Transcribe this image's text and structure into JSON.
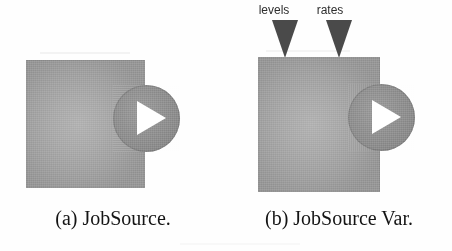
{
  "figure": {
    "background_color": "#fefefe",
    "box_fill_color": "#a8a8a8",
    "circle_fill_color": "#8f8f8f",
    "play_glyph_color": "#ffffff",
    "marker_color": "#4a4a4a",
    "text_color": "#141414"
  },
  "panels": [
    {
      "id": "a",
      "caption": "(a) JobSource.",
      "component_name": "JobSource",
      "output_port_icon": "play-icon",
      "inputs": []
    },
    {
      "id": "b",
      "caption": "(b) JobSource Var.",
      "component_name": "JobSource Var.",
      "output_port_icon": "play-icon",
      "inputs": [
        {
          "label": "levels",
          "marker_icon": "down-triangle-icon"
        },
        {
          "label": "rates",
          "marker_icon": "down-triangle-icon"
        }
      ]
    }
  ]
}
